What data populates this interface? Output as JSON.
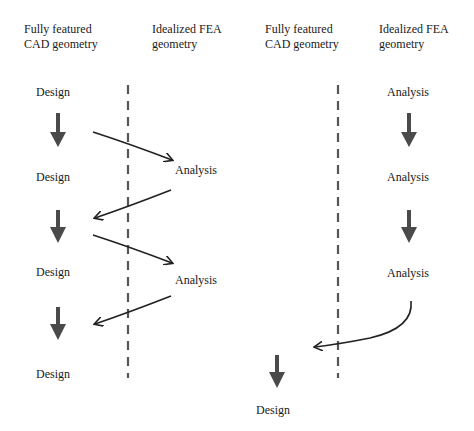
{
  "left_panel": {
    "header_cad": "Fully featured\nCAD geometry",
    "header_fea": "Idealized FEA\ngeometry",
    "steps": [
      {
        "label": "Design",
        "column": "cad"
      },
      {
        "label": "Analysis",
        "column": "fea"
      },
      {
        "label": "Design",
        "column": "cad"
      },
      {
        "label": "Analysis",
        "column": "fea"
      },
      {
        "label": "Design",
        "column": "cad"
      },
      {
        "label": "Design",
        "column": "cad"
      }
    ]
  },
  "right_panel": {
    "header_cad": "Fully featured\nCAD geometry",
    "header_fea": "Idealized FEA\ngeometry",
    "steps": [
      {
        "label": "Analysis",
        "column": "fea"
      },
      {
        "label": "Analysis",
        "column": "fea"
      },
      {
        "label": "Analysis",
        "column": "fea"
      },
      {
        "label": "Design",
        "column": "cad"
      }
    ]
  },
  "colors": {
    "thick_arrow": "#4a4a4a",
    "thin_arrow": "#222222",
    "divider": "#555555",
    "text": "#1a1a1a"
  }
}
